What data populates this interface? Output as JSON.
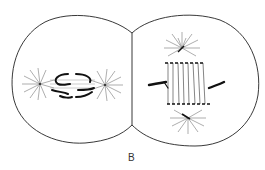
{
  "figure": {
    "label": "B",
    "left_cell": {
      "stage": "spindle with asters at left and right poles, chromosomes at center"
    },
    "right_cell": {
      "stage": "vertical spindle with asters at top and bottom poles, chromosomes flanking"
    }
  },
  "colors": {
    "line": "#222222",
    "ray": "#777777",
    "background": "#ffffff"
  }
}
